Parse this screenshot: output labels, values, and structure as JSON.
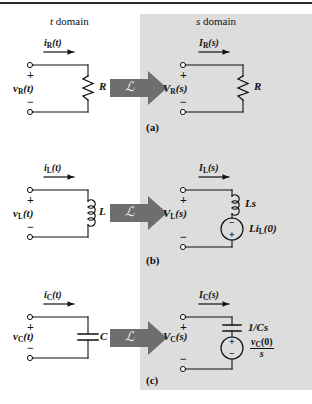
{
  "figure": {
    "headers": {
      "t_domain": "t",
      "t_domain_word": "domain",
      "s_domain": "s",
      "s_domain_word": "domain"
    },
    "captions": {
      "a": "(a)",
      "b": "(b)",
      "c": "(c)"
    },
    "transform_symbol": "ℒ",
    "colors": {
      "panel_gray": "#dddddd",
      "arrow_gray": "#6e6e6e",
      "arrow_dark": "#555555",
      "ink": "#111111",
      "border": "#2b2b2b"
    }
  },
  "rows": [
    {
      "id": "resistor",
      "caption": "(a)",
      "t": {
        "current_label": {
          "base": "i",
          "sub": "R",
          "arg": "(t)"
        },
        "voltage_label": {
          "base": "v",
          "sub": "R",
          "arg": "(t)"
        },
        "element_label": "R",
        "plus": "+",
        "minus": "−"
      },
      "s": {
        "current_label": {
          "base": "I",
          "sub": "R",
          "arg": "(s)"
        },
        "voltage_label": {
          "base": "V",
          "sub": "R",
          "arg": "(s)"
        },
        "element_label": "R",
        "plus": "+",
        "minus": "−",
        "source": null
      }
    },
    {
      "id": "inductor",
      "caption": "(b)",
      "t": {
        "current_label": {
          "base": "i",
          "sub": "L",
          "arg": "(t)"
        },
        "voltage_label": {
          "base": "v",
          "sub": "L",
          "arg": "(t)"
        },
        "element_label": "L",
        "plus": "+",
        "minus": "−"
      },
      "s": {
        "current_label": {
          "base": "I",
          "sub": "L",
          "arg": "(s)"
        },
        "voltage_label": {
          "base": "V",
          "sub": "L",
          "arg": "(s)"
        },
        "element_label": "Ls",
        "plus": "+",
        "minus": "−",
        "source": {
          "label": {
            "base": "Li",
            "sub": "L",
            "arg": "(0)"
          },
          "top_sign": "−",
          "bottom_sign": "+"
        }
      }
    },
    {
      "id": "capacitor",
      "caption": "(c)",
      "t": {
        "current_label": {
          "base": "i",
          "sub": "C",
          "arg": "(t)"
        },
        "voltage_label": {
          "base": "v",
          "sub": "C",
          "arg": "(t)"
        },
        "element_label": "C",
        "plus": "+",
        "minus": "−"
      },
      "s": {
        "current_label": {
          "base": "I",
          "sub": "C",
          "arg": "(s)"
        },
        "voltage_label": {
          "base": "V",
          "sub": "C",
          "arg": "(s)"
        },
        "element_label": "1/Cs",
        "plus": "+",
        "minus": "−",
        "source": {
          "label": {
            "numerator_base": "v",
            "numerator_sub": "C",
            "numerator_arg": "(0)",
            "denominator": "s"
          },
          "top_sign": "+",
          "bottom_sign": "−"
        }
      }
    }
  ]
}
